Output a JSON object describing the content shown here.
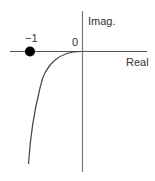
{
  "diagram": {
    "axes": {
      "real_label": "Real",
      "imag_label": "Imag.",
      "origin_label": "0"
    },
    "points": [
      {
        "label": "−1",
        "type": "pole",
        "marker": "filled-circle",
        "position": "-1 on real axis"
      }
    ],
    "curves": [
      {
        "description": "branch from origin curving down-left toward lower-left",
        "start": "origin",
        "direction": "down-left"
      }
    ],
    "colors": {
      "axis": "#888888",
      "curve": "#555555",
      "marker": "#000000",
      "text": "#333333"
    }
  }
}
